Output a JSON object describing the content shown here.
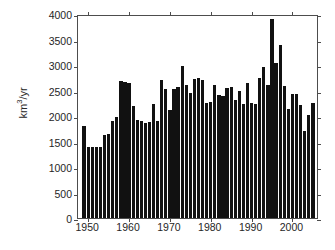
{
  "chart_data": {
    "type": "bar",
    "title": "",
    "subtitle": "",
    "xlabel": "",
    "ylabel": "km3/yr",
    "ylabel_parts": {
      "pre": "km",
      "sup": "3",
      "post": "/yr"
    },
    "xlim": [
      1947.5,
      2006.5
    ],
    "ylim": [
      0,
      4000
    ],
    "yticks": [
      0,
      500,
      1000,
      1500,
      2000,
      2500,
      3000,
      3500,
      4000
    ],
    "ytick_labels": [
      "0",
      "500",
      "1000",
      "1500",
      "2000",
      "2500",
      "3000",
      "3500",
      "4000"
    ],
    "xticks": [
      1950,
      1960,
      1970,
      1980,
      1990,
      2000
    ],
    "xtick_labels": [
      "1950",
      "1960",
      "1970",
      "1980",
      "1990",
      "2000"
    ],
    "grid": false,
    "legend": null,
    "bar_color": "#111111",
    "axes_color": "#4d4d4d",
    "categories": [
      1949,
      1950,
      1951,
      1952,
      1953,
      1954,
      1955,
      1956,
      1957,
      1958,
      1959,
      1960,
      1961,
      1962,
      1963,
      1964,
      1965,
      1966,
      1967,
      1968,
      1969,
      1970,
      1971,
      1972,
      1973,
      1974,
      1975,
      1976,
      1977,
      1978,
      1979,
      1980,
      1981,
      1982,
      1983,
      1984,
      1985,
      1986,
      1987,
      1988,
      1989,
      1990,
      1991,
      1992,
      1993,
      1994,
      1995,
      1996,
      1997,
      1998,
      1999,
      2000,
      2001,
      2002,
      2003,
      2004,
      2005
    ],
    "values": [
      1800,
      1390,
      1395,
      1400,
      1390,
      1625,
      1640,
      1900,
      1985,
      2695,
      2660,
      2650,
      2200,
      1930,
      1910,
      1870,
      1880,
      2240,
      1895,
      2715,
      2530,
      2110,
      2520,
      2560,
      2980,
      2600,
      2460,
      2735,
      2740,
      2710,
      2250,
      2275,
      2610,
      2405,
      2395,
      2545,
      2560,
      2310,
      2490,
      2240,
      2650,
      2255,
      2240,
      2745,
      2960,
      2600,
      3905,
      3045,
      3385,
      2595,
      2140,
      2440,
      2425,
      2210,
      1700,
      2020,
      2265
    ]
  }
}
